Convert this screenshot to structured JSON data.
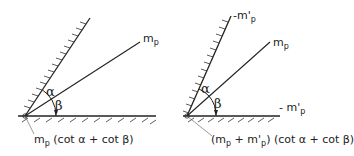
{
  "diagrams": [
    {
      "id": "left",
      "angle_labels": {
        "alpha": "α",
        "beta": "β"
      },
      "line_label": {
        "main": "m",
        "sub": "p"
      },
      "formula": {
        "m": "m",
        "sub": "p",
        "rest": " (cot α + cot β)"
      }
    },
    {
      "id": "right",
      "angle_labels": {
        "alpha": "α",
        "beta": "β"
      },
      "top_label": {
        "main": "m'",
        "sub": "p",
        "prefix": "-"
      },
      "line_label": {
        "main": "m",
        "sub": "p"
      },
      "bottom_label": {
        "prefix": "- ",
        "main": "m'",
        "sub": "p"
      },
      "formula": {
        "open": "(m",
        "sub1": "p",
        "plus": " + m'",
        "sub2": "p",
        "rest": ") (cot α + cot β)"
      }
    }
  ],
  "colors": {
    "ink": "#222222",
    "background": "#ffffff"
  }
}
